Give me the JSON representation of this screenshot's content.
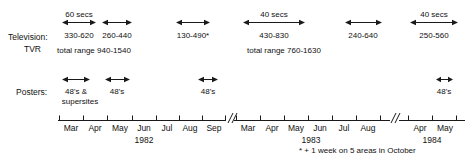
{
  "figure": {
    "footnote": "* + 1 week on 5 areas in October",
    "line_color": "#1a1a1a",
    "text_color": "#111111",
    "background": "#ffffff"
  },
  "rows": [
    {
      "id": "television",
      "label_line1": "Television:",
      "label_line2": "TVR"
    },
    {
      "id": "posters",
      "label_line1": "Posters:",
      "label_line2": ""
    }
  ],
  "television": {
    "bursts": [
      {
        "duration": "60 secs",
        "range": "330-620",
        "x1": 62,
        "x2": 96
      },
      {
        "duration": "",
        "range": "260-440",
        "x1": 102,
        "x2": 132
      },
      {
        "duration": "",
        "range": "130-490*",
        "x1": 176,
        "x2": 210
      },
      {
        "duration": "40 secs",
        "range": "430-830",
        "x1": 243,
        "x2": 305
      },
      {
        "duration": "",
        "range": "240-640",
        "x1": 345,
        "x2": 382
      },
      {
        "duration": "40 secs",
        "range": "250-560",
        "x1": 410,
        "x2": 458
      }
    ],
    "totals": [
      {
        "text": "total range 940-1540",
        "x": 57
      },
      {
        "text": "total range 760-1630",
        "x": 247
      }
    ]
  },
  "posters": {
    "bursts": [
      {
        "label_line1": "48's &",
        "label_line2": "supersites",
        "x1": 62,
        "x2": 90
      },
      {
        "label_line1": "48's",
        "label_line2": "",
        "x1": 105,
        "x2": 130
      },
      {
        "label_line1": "48's",
        "label_line2": "",
        "x1": 198,
        "x2": 218
      },
      {
        "label_line1": "48's",
        "label_line2": "",
        "x1": 436,
        "x2": 452
      }
    ]
  },
  "axis": {
    "y": 120,
    "start_x": 58,
    "end_x": 465,
    "breaks": [
      {
        "x": 229
      },
      {
        "x": 394
      }
    ],
    "segments": [
      {
        "year": "1982",
        "year_x": 144,
        "months": [
          {
            "label": "Mar",
            "x": 71
          },
          {
            "label": "Apr",
            "x": 95
          },
          {
            "label": "May",
            "x": 120
          },
          {
            "label": "Jun",
            "x": 144
          },
          {
            "label": "Jul",
            "x": 167
          },
          {
            "label": "Aug",
            "x": 190
          },
          {
            "label": "Sep",
            "x": 214
          }
        ]
      },
      {
        "year": "1983",
        "year_x": 311,
        "months": [
          {
            "label": "Mar",
            "x": 248
          },
          {
            "label": "Apr",
            "x": 272
          },
          {
            "label": "May",
            "x": 296
          },
          {
            "label": "Jun",
            "x": 320
          },
          {
            "label": "Jul",
            "x": 344
          },
          {
            "label": "Aug",
            "x": 368
          }
        ]
      },
      {
        "year": "1984",
        "year_x": 432,
        "months": [
          {
            "label": "Apr",
            "x": 420
          },
          {
            "label": "May",
            "x": 445
          }
        ]
      }
    ],
    "tick_positions": [
      59,
      83,
      107,
      132,
      156,
      179,
      202,
      226,
      236,
      260,
      284,
      308,
      332,
      356,
      380,
      408,
      432,
      457
    ]
  }
}
